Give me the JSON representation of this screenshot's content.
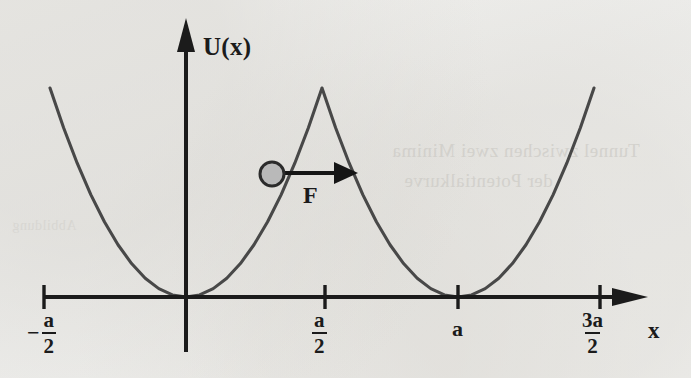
{
  "figure": {
    "kind": "physics-diagram",
    "background_color": "#f1f1ef",
    "ink_color": "#3a3a3a",
    "axis_color": "#1b1b1b"
  },
  "axes": {
    "y_axis_label": "U(x)",
    "x_axis_label": "x",
    "origin_px": {
      "x": 186,
      "y": 297
    },
    "x_axis_start_px": 44,
    "x_axis_end_px": 648,
    "y_axis_top_px": 18,
    "y_axis_bottom_px": 352,
    "ticks": [
      {
        "name": "neg-a-over-2",
        "numerator": "a",
        "denominator": "2",
        "sign": "−",
        "x_px": 44,
        "x_value": -0.5
      },
      {
        "name": "a-over-2",
        "numerator": "a",
        "denominator": "2",
        "sign": "",
        "x_px": 325,
        "x_value": 0.5
      },
      {
        "name": "a",
        "numerator": "a",
        "denominator": "",
        "sign": "",
        "x_px": 458,
        "x_value": 1.0
      },
      {
        "name": "3a-over-2",
        "numerator": "3a",
        "denominator": "2",
        "sign": "",
        "x_px": 600,
        "x_value": 1.5
      }
    ]
  },
  "annotations": {
    "force_label": "F",
    "force_arrow": {
      "from_px": {
        "x": 282,
        "y": 173
      },
      "to_px": {
        "x": 358,
        "y": 173
      },
      "direction": "right"
    },
    "particle": {
      "name": "ball",
      "center_px": {
        "x": 272,
        "y": 174
      },
      "radius_px": 12,
      "fill_color": "#b9b9b9",
      "stroke_color": "#2b2b2b"
    }
  },
  "bleed_through": {
    "note": "faint mirrored text showing through scanned page",
    "line_1": "Tunnel zwischen zwei Minima",
    "line_2": "der Potentialkurve",
    "line_3": "Abbildung"
  },
  "chart_data": {
    "type": "line",
    "title": "",
    "xlabel": "x",
    "ylabel": "U(x)",
    "xlim": [
      -0.62,
      1.72
    ],
    "ylim": [
      0,
      1.18
    ],
    "grid": false,
    "legend": null,
    "period": 1.0,
    "minima_x": [
      0.0,
      1.0
    ],
    "maxima_x": [
      -0.5,
      0.5,
      1.5
    ],
    "barrier_peak_value": 1.0,
    "well_minimum_value": 0.0,
    "formula": "U(x) = Umax * ( (2/a) * dist(x, nearest multiple of a) )^2",
    "series": [
      {
        "name": "U(x)",
        "x": [
          -0.5,
          -0.45,
          -0.4,
          -0.35,
          -0.3,
          -0.25,
          -0.2,
          -0.15,
          -0.1,
          -0.05,
          0.0,
          0.05,
          0.1,
          0.15,
          0.2,
          0.25,
          0.3,
          0.35,
          0.4,
          0.45,
          0.5,
          0.55,
          0.6,
          0.65,
          0.7,
          0.75,
          0.8,
          0.85,
          0.9,
          0.95,
          1.0,
          1.05,
          1.1,
          1.15,
          1.2,
          1.25,
          1.3,
          1.35,
          1.4,
          1.45,
          1.5
        ],
        "y": [
          1.0,
          0.81,
          0.64,
          0.49,
          0.36,
          0.25,
          0.16,
          0.09,
          0.04,
          0.01,
          0.0,
          0.01,
          0.04,
          0.09,
          0.16,
          0.25,
          0.36,
          0.49,
          0.64,
          0.81,
          1.0,
          0.81,
          0.64,
          0.49,
          0.36,
          0.25,
          0.16,
          0.09,
          0.04,
          0.01,
          0.0,
          0.01,
          0.04,
          0.09,
          0.16,
          0.25,
          0.36,
          0.49,
          0.64,
          0.81,
          1.0
        ]
      }
    ],
    "markers": [
      {
        "name": "particle",
        "x": 0.35,
        "y": 0.49,
        "label": ""
      }
    ],
    "arrows": [
      {
        "name": "force",
        "label": "F",
        "x_from": 0.37,
        "x_to": 0.53,
        "y": 0.5
      }
    ]
  }
}
